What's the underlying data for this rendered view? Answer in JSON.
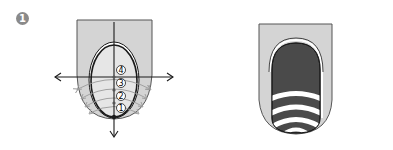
{
  "figure": {
    "step_badge": "1",
    "left_panel": {
      "description": "Nail diagram with axes and numbered arc guide lines",
      "markers": [
        "4",
        "3",
        "2",
        "1"
      ],
      "arrows": [
        "left",
        "right",
        "up",
        "down"
      ]
    },
    "right_panel": {
      "description": "Finished nail design with dark base and white curved stripes",
      "stripe_count": 4
    },
    "colors": {
      "finger": "#d4d4d4",
      "nail_left": "#e6e6e6",
      "nail_dark": "#4a4a4a",
      "stripe": "#ffffff",
      "line": "#1a1a1a",
      "guide": "#9a9a9a",
      "badge": "#8a8a8a"
    }
  }
}
